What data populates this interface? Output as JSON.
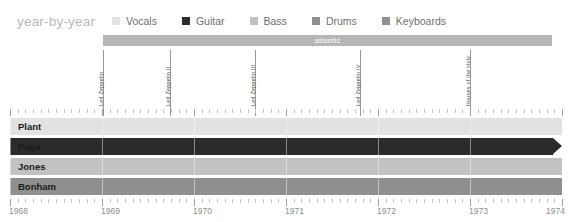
{
  "header": {
    "title": "year-by-year",
    "legend": [
      {
        "label": "Vocals",
        "color": "#e2e2e2"
      },
      {
        "label": "Guitar",
        "color": "#2b2b2b"
      },
      {
        "label": "Bass",
        "color": "#c2c2c2"
      },
      {
        "label": "Drums",
        "color": "#8f8f8f"
      },
      {
        "label": "Keyboards",
        "color": "#8f8f8f"
      }
    ]
  },
  "label_band": {
    "text": "atlantic",
    "color": "#b6b6b6",
    "start_px": 103,
    "width_px": 449
  },
  "chart_data": {
    "type": "timeline",
    "title": "year-by-year",
    "xlabel": "",
    "ylabel": "",
    "xlim": [
      1968,
      1974
    ],
    "grid": true,
    "legend_position": "top",
    "year_ticks": [
      "1968",
      "1969",
      "1970",
      "1971",
      "1972",
      "1973",
      "1974"
    ],
    "markers": [
      {
        "label": "Led Zeppelin",
        "x_px": 103
      },
      {
        "label": "Led Zeppelin II",
        "x_px": 170
      },
      {
        "label": "Led Zeppelin III",
        "x_px": 255
      },
      {
        "label": "Led Zeppelin IV",
        "x_px": 360
      },
      {
        "label": "Houses of the Holy",
        "x_px": 470
      }
    ],
    "members": [
      {
        "name": "Plant",
        "instrument": "Vocals",
        "color": "#e2e2e2",
        "start_px": 0,
        "width_px": 552,
        "arrow": false
      },
      {
        "name": "Page",
        "instrument": "Guitar",
        "color": "#2b2b2b",
        "start_px": 0,
        "width_px": 543,
        "arrow": true
      },
      {
        "name": "Jones",
        "instrument": "Bass",
        "color": "#c2c2c2",
        "start_px": 0,
        "width_px": 552,
        "arrow": false
      },
      {
        "name": "Bonham",
        "instrument": "Drums",
        "color": "#8f8f8f",
        "start_px": 0,
        "width_px": 552,
        "arrow": false
      }
    ]
  }
}
